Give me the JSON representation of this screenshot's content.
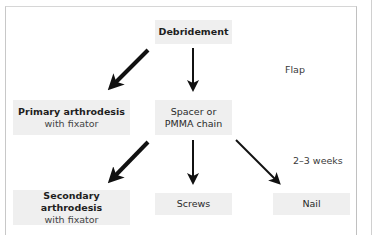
{
  "diagram": {
    "nodes": {
      "debridement": {
        "title": "Debridement"
      },
      "primary": {
        "title": "Primary arthrodesis",
        "subtitle": "with fixator"
      },
      "spacer": {
        "line1": "Spacer or",
        "line2": "PMMA chain"
      },
      "secondary": {
        "title": "Secondary arthrodesis",
        "subtitle": "with fixator"
      },
      "screws": {
        "title": "Screws"
      },
      "nail": {
        "title": "Nail"
      }
    },
    "labels": {
      "flap": "Flap",
      "interval": "2–3 weeks"
    },
    "edges": [
      {
        "from": "debridement",
        "to": "primary",
        "style": "thick"
      },
      {
        "from": "debridement",
        "to": "spacer",
        "style": "thin"
      },
      {
        "from": "spacer",
        "to": "secondary",
        "style": "thick"
      },
      {
        "from": "spacer",
        "to": "screws",
        "style": "thin"
      },
      {
        "from": "spacer",
        "to": "nail",
        "style": "thin"
      }
    ],
    "colors": {
      "node_fill": "#efefef",
      "arrow": "#111111",
      "frame": "#c8c8c8"
    }
  }
}
